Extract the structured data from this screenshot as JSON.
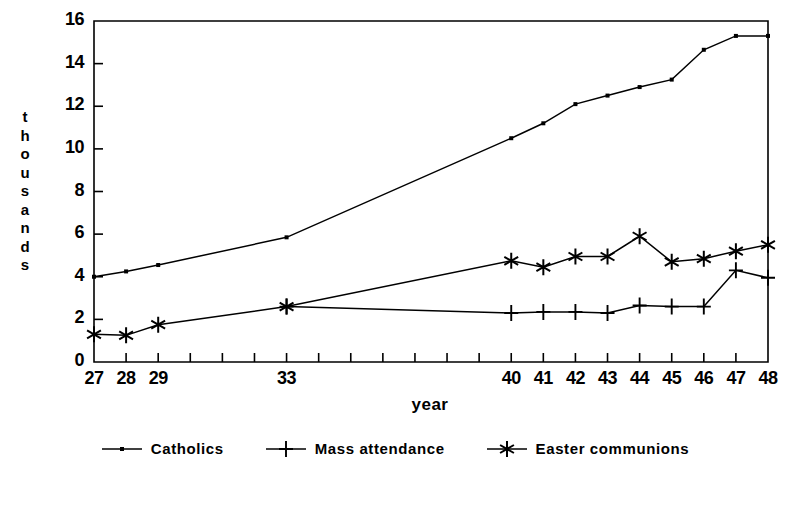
{
  "chart_data": {
    "type": "line",
    "title": "",
    "xlabel": "year",
    "ylabel": "thousands",
    "ylabel_chars": [
      "t",
      "h",
      "o",
      "u",
      "s",
      "a",
      "n",
      "d",
      "s"
    ],
    "x": [
      27,
      28,
      29,
      30,
      31,
      32,
      33,
      40,
      41,
      42,
      43,
      44,
      45,
      46,
      47,
      48
    ],
    "xlim": [
      27,
      48
    ],
    "ylim": [
      0,
      16
    ],
    "yticks": [
      0,
      2,
      4,
      6,
      8,
      10,
      12,
      14,
      16
    ],
    "ytick_labels": [
      "0",
      "2",
      "4",
      "6",
      "8",
      "10",
      "12",
      "14",
      "16"
    ],
    "xticks": [
      27,
      28,
      29,
      30,
      31,
      32,
      33,
      34,
      35,
      36,
      37,
      38,
      39,
      40,
      41,
      42,
      43,
      44,
      45,
      46,
      47,
      48
    ],
    "xtick_labels_shown": [
      {
        "x": 27,
        "label": "27"
      },
      {
        "x": 28,
        "label": "28"
      },
      {
        "x": 29,
        "label": "29"
      },
      {
        "x": 33,
        "label": "33"
      },
      {
        "x": 40,
        "label": "40"
      },
      {
        "x": 41,
        "label": "41"
      },
      {
        "x": 42,
        "label": "42"
      },
      {
        "x": 43,
        "label": "43"
      },
      {
        "x": 44,
        "label": "44"
      },
      {
        "x": 45,
        "label": "45"
      },
      {
        "x": 46,
        "label": "46"
      },
      {
        "x": 47,
        "label": "47"
      },
      {
        "x": 48,
        "label": "48"
      }
    ],
    "grid": false,
    "legend_position": "below",
    "line_color": "#000000",
    "frame_color": "#000000",
    "series": [
      {
        "name": "Catholics",
        "marker": "dot",
        "x": [
          27,
          28,
          29,
          33,
          40,
          41,
          42,
          43,
          44,
          45,
          46,
          47,
          48
        ],
        "values": [
          4.0,
          4.25,
          4.55,
          5.85,
          10.5,
          11.2,
          12.1,
          12.5,
          12.9,
          13.25,
          14.65,
          15.3,
          15.3
        ]
      },
      {
        "name": "Mass attendance",
        "marker": "plus",
        "x": [
          33,
          40,
          41,
          42,
          43,
          44,
          45,
          46,
          47,
          48
        ],
        "values": [
          2.6,
          2.3,
          2.35,
          2.35,
          2.3,
          2.65,
          2.6,
          2.6,
          4.3,
          3.95
        ]
      },
      {
        "name": "Easter communions",
        "marker": "asterisk",
        "x": [
          27,
          28,
          29,
          33,
          40,
          41,
          42,
          43,
          44,
          45,
          46,
          47,
          48
        ],
        "values": [
          1.3,
          1.25,
          1.75,
          2.6,
          4.75,
          4.45,
          4.95,
          4.95,
          5.9,
          4.7,
          4.85,
          5.2,
          5.5
        ]
      }
    ]
  }
}
